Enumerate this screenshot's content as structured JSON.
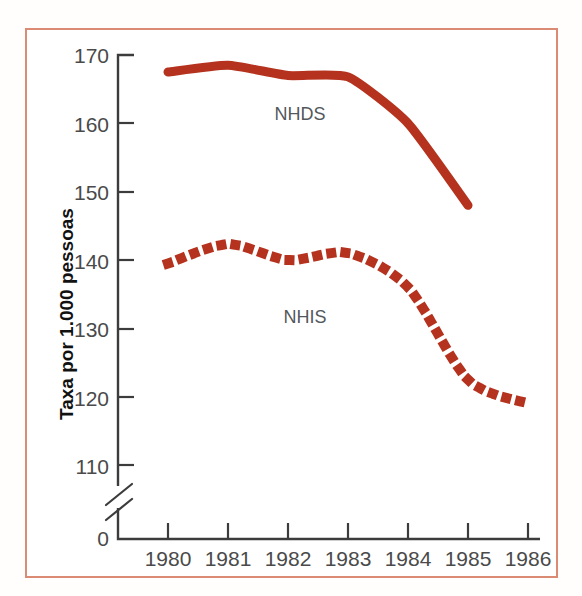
{
  "figure": {
    "border_color": "#db8b74",
    "background_color": "#ffffff"
  },
  "chart_data": {
    "type": "line",
    "title": "",
    "subtitle": "",
    "xlabel": "",
    "ylabel": "Taxa por 1.000 pessoas",
    "x": [
      1980,
      1981,
      1982,
      1983,
      1984,
      1985,
      1986
    ],
    "categories": [
      "1980",
      "1981",
      "1982",
      "1983",
      "1984",
      "1985",
      "1986"
    ],
    "xlim": [
      1979.2,
      1986.6
    ],
    "ylim": [
      105,
      172
    ],
    "ytick_values": [
      0,
      110,
      120,
      130,
      140,
      150,
      160,
      170
    ],
    "ytick_labels": [
      "0",
      "110",
      "120",
      "130",
      "140",
      "150",
      "160",
      "170"
    ],
    "xtick_labels": [
      "1980",
      "1981",
      "1982",
      "1983",
      "1984",
      "1985",
      "1986"
    ],
    "grid": false,
    "legend_position": "inline-annotation",
    "axis_break": true,
    "axis_break_between": [
      0,
      110
    ],
    "series": [
      {
        "name": "NHDS",
        "style": "solid",
        "color": "#b5331e",
        "x": [
          1980,
          1981,
          1982,
          1983,
          1984,
          1985
        ],
        "values": [
          167.5,
          168.5,
          167.0,
          166.8,
          160.0,
          148.0
        ],
        "label_text": "NHDS"
      },
      {
        "name": "NHIS",
        "style": "dotted",
        "color": "#b5331e",
        "x": [
          1980,
          1981,
          1982,
          1983,
          1984,
          1985,
          1986
        ],
        "values": [
          139.5,
          142.3,
          140.0,
          141.0,
          136.0,
          122.5,
          119.0
        ],
        "label_text": "NHIS"
      }
    ],
    "annotations": [
      {
        "text": "NHDS",
        "x": 1982.0,
        "y": 162.0
      },
      {
        "text": "NHIS",
        "x": 1982.0,
        "y": 134.0
      }
    ]
  }
}
